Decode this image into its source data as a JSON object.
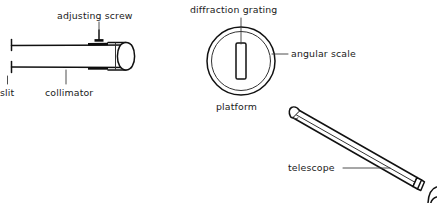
{
  "figure": {
    "background_color": "#ffffff",
    "ink_color": "#111111",
    "width": 437,
    "height": 203
  },
  "labels": {
    "adjusting_screw": "adjusting  screw",
    "slit": "slit",
    "collimator": "collimator",
    "diffraction_grating": "diffraction grating",
    "angular_scale": "angular scale",
    "platform": "platform",
    "telescope": "telescope"
  },
  "parts": [
    {
      "id": "collimator",
      "label": "collimator",
      "description": "horizontal tube with slit at left end and lens barrel at right end"
    },
    {
      "id": "slit",
      "label": "slit",
      "description": "vertical aperture marks at the left end of the collimator"
    },
    {
      "id": "adjusting-screw",
      "label": "adjusting  screw",
      "description": "small T-shaped screw on top of collimator barrel"
    },
    {
      "id": "diffraction-grating",
      "label": "diffraction grating",
      "description": "vertical rectangular grating standing on the platform"
    },
    {
      "id": "angular-scale",
      "label": "angular scale",
      "description": "outer ring of the circular platform"
    },
    {
      "id": "platform",
      "label": "platform",
      "description": "circular rotating table seen from above"
    },
    {
      "id": "telescope",
      "label": "telescope",
      "description": "tilted tapering tube with objective at upper left and eyepiece at lower right"
    }
  ],
  "icons": {
    "leader_line": "leader-line",
    "tube": "tube-shape",
    "circle": "circle-shape"
  }
}
